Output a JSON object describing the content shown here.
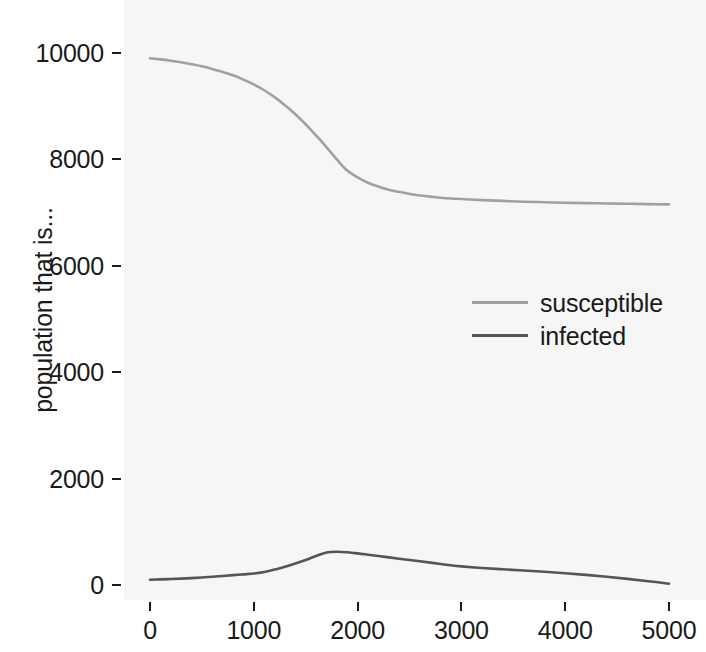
{
  "chart_data": {
    "type": "line",
    "title": "",
    "subtitle": "",
    "xlabel": "",
    "ylabel": "population that is...",
    "xlim": [
      -110,
      5180
    ],
    "ylim": [
      -280,
      10290
    ],
    "grid": false,
    "panel_background": "#f6f6f6",
    "legend_position": "center-right-inside",
    "x_ticks": [
      0,
      1000,
      2000,
      3000,
      4000,
      5000
    ],
    "x_tick_labels": [
      "0",
      "1000",
      "2000",
      "3000",
      "4000",
      "5000"
    ],
    "y_ticks": [
      0,
      2000,
      4000,
      6000,
      8000,
      10000
    ],
    "y_tick_labels": [
      "0",
      "2000",
      "4000",
      "6000",
      "8000",
      "10000"
    ],
    "x": [
      0,
      100,
      200,
      300,
      400,
      500,
      600,
      700,
      800,
      900,
      1000,
      1100,
      1200,
      1300,
      1400,
      1500,
      1600,
      1700,
      1800,
      1900,
      2000,
      2100,
      2200,
      2300,
      2400,
      2500,
      2600,
      2700,
      2800,
      2900,
      3000,
      3200,
      3400,
      3600,
      3800,
      4000,
      4200,
      4400,
      4600,
      4800,
      5000
    ],
    "series": [
      {
        "name": "susceptible",
        "color": "#a0a0a0",
        "values": [
          9900,
          9880,
          9855,
          9825,
          9790,
          9750,
          9700,
          9645,
          9580,
          9500,
          9410,
          9300,
          9170,
          9020,
          8850,
          8660,
          8450,
          8230,
          8000,
          7790,
          7660,
          7560,
          7490,
          7430,
          7390,
          7350,
          7320,
          7300,
          7280,
          7265,
          7255,
          7235,
          7220,
          7205,
          7195,
          7185,
          7178,
          7172,
          7166,
          7160,
          7155
        ]
      },
      {
        "name": "infected",
        "color": "#555555",
        "values": [
          100,
          105,
          112,
          120,
          130,
          142,
          155,
          170,
          185,
          200,
          215,
          245,
          290,
          345,
          405,
          470,
          545,
          610,
          625,
          615,
          595,
          570,
          545,
          520,
          495,
          470,
          445,
          420,
          395,
          370,
          350,
          320,
          295,
          272,
          250,
          222,
          190,
          155,
          115,
          72,
          25
        ]
      }
    ]
  },
  "legend": {
    "entries": [
      {
        "label": "susceptible",
        "color": "#a0a0a0"
      },
      {
        "label": "infected",
        "color": "#555555"
      }
    ]
  }
}
